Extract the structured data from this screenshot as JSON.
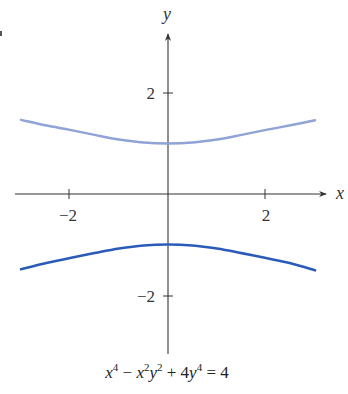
{
  "chart_data": {
    "type": "line",
    "title": "",
    "caption": "x^4 - x^2 y^2 + 4y^4 = 4",
    "xlabel": "x",
    "ylabel": "y",
    "xlim": [
      -3.1,
      3.3
    ],
    "ylim": [
      -3.2,
      3.3
    ],
    "grid": false,
    "legend": null,
    "x_ticks": [
      -2,
      2
    ],
    "x_tick_labels": [
      "−2",
      "2"
    ],
    "y_ticks": [
      2,
      -2
    ],
    "y_tick_labels": [
      "2",
      "−2"
    ],
    "series": [
      {
        "name": "upper branch",
        "color": "#8fa3d6",
        "x": [
          -3.0,
          -2.5,
          -2.0,
          -1.5,
          -1.0,
          -0.5,
          0.0,
          0.5,
          1.0,
          1.5,
          2.0,
          2.5,
          3.0
        ],
        "y": [
          1.47,
          1.36,
          1.27,
          1.17,
          1.08,
          1.02,
          1.0,
          1.02,
          1.08,
          1.17,
          1.27,
          1.36,
          1.46
        ]
      },
      {
        "name": "lower branch",
        "color": "#2a5bb8",
        "x": [
          -3.0,
          -2.5,
          -2.0,
          -1.5,
          -1.0,
          -0.5,
          0.0,
          0.5,
          1.0,
          1.5,
          2.0,
          2.5,
          3.0
        ],
        "y": [
          -1.49,
          -1.37,
          -1.27,
          -1.17,
          -1.08,
          -1.02,
          -1.0,
          -1.02,
          -1.08,
          -1.17,
          -1.27,
          -1.37,
          -1.51
        ]
      }
    ]
  },
  "axes": {
    "x_label": "x",
    "y_label": "y",
    "x_tick_neg": "−2",
    "x_tick_pos": "2",
    "y_tick_pos": "2",
    "y_tick_neg": "−2"
  },
  "caption": {
    "t1": "x",
    "e1": "4",
    "op1": " − ",
    "t2": "x",
    "e2": "2",
    "t3": "y",
    "e3": "2",
    "op2": " + 4",
    "t4": "y",
    "e4": "4",
    "rhs": " = 4"
  }
}
